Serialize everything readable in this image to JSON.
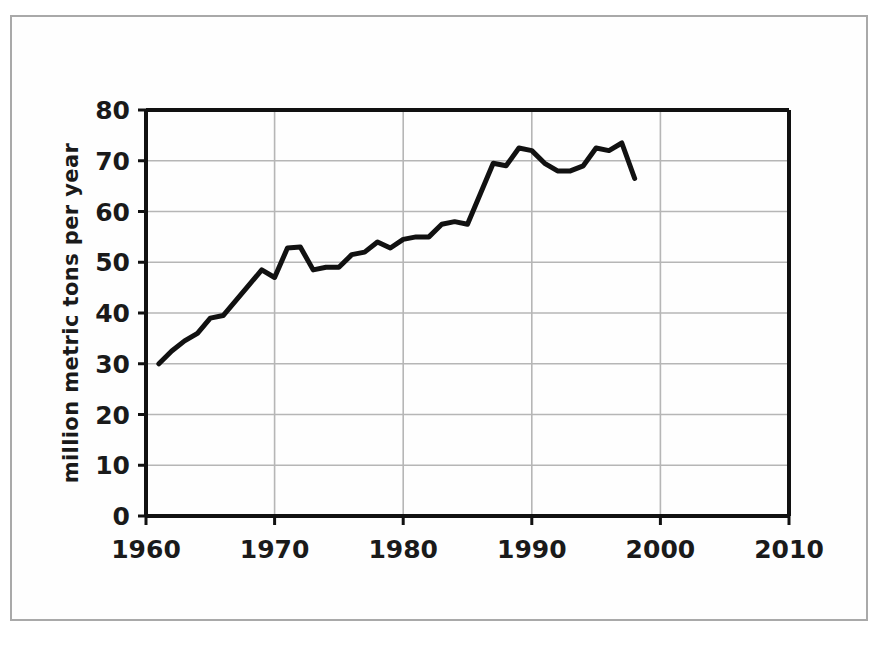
{
  "figure": {
    "background_color": "#ffffff",
    "frame_color": "#a9a9a9",
    "line_color": "#111111",
    "grid_color": "#b6b6b6"
  },
  "axis": {
    "y_title": "million metric tons per year",
    "y_ticks": [
      "0",
      "10",
      "20",
      "30",
      "40",
      "50",
      "60",
      "70",
      "80"
    ],
    "x_ticks": [
      "1960",
      "1970",
      "1980",
      "1990",
      "2000",
      "2010"
    ]
  },
  "chart_data": {
    "type": "line",
    "title": "",
    "subtitle": "",
    "xlabel": "",
    "ylabel": "million metric tons per year",
    "xlim": [
      1960,
      2010
    ],
    "ylim": [
      0,
      80
    ],
    "xticks": [
      1960,
      1970,
      1980,
      1990,
      2000,
      2010
    ],
    "yticks": [
      0,
      10,
      20,
      30,
      40,
      50,
      60,
      70,
      80
    ],
    "grid": true,
    "legend": null,
    "series": [
      {
        "name": "production",
        "x": [
          1961,
          1962,
          1963,
          1964,
          1965,
          1966,
          1967,
          1968,
          1969,
          1970,
          1971,
          1972,
          1973,
          1974,
          1975,
          1976,
          1977,
          1978,
          1979,
          1980,
          1981,
          1982,
          1983,
          1984,
          1985,
          1986,
          1987,
          1988,
          1989,
          1990,
          1991,
          1992,
          1993,
          1994,
          1995,
          1996,
          1997,
          1998
        ],
        "values": [
          30.0,
          32.5,
          34.5,
          36.0,
          39.0,
          39.5,
          42.5,
          45.5,
          48.5,
          47.0,
          52.8,
          53.0,
          48.5,
          49.0,
          49.0,
          51.5,
          52.0,
          54.0,
          52.8,
          54.5,
          55.0,
          55.0,
          57.5,
          58.0,
          57.5,
          63.5,
          69.5,
          69.0,
          72.5,
          72.0,
          69.5,
          68.0,
          68.0,
          69.0,
          72.5,
          72.0,
          73.5,
          66.5
        ]
      }
    ]
  }
}
